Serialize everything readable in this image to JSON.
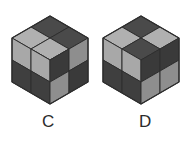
{
  "page": {
    "background_color": "#ffffff",
    "width": 194,
    "height": 144
  },
  "palette": {
    "top_dark": "#4a4a4a",
    "top_light": "#b0b0b0",
    "left_dark": "#3f3f3f",
    "left_light": "#a8a8a8",
    "right_dark": "#3a3a3a",
    "right_light": "#8e8e8e",
    "outline": "#2e2e2e",
    "label_color": "#2b2b2b"
  },
  "figures": [
    {
      "id": "c",
      "label": "C",
      "shape": "notched 2x2x2 cube",
      "faces": {
        "top": [
          "dark",
          "light",
          "light"
        ],
        "left": [
          "light",
          "light",
          "dark",
          "light"
        ],
        "right": [
          "dark",
          "light",
          "light",
          "dark"
        ]
      }
    },
    {
      "id": "d",
      "label": "D",
      "shape": "full 2x2x2 cube",
      "faces": {
        "top": [
          "dark",
          "light",
          "light",
          "dark"
        ],
        "left": [
          "light",
          "light",
          "dark",
          "dark"
        ],
        "right": [
          "dark",
          "dark",
          "light",
          "light"
        ]
      }
    }
  ]
}
